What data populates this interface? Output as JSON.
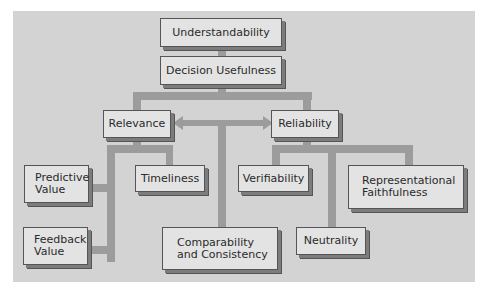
{
  "diagram": {
    "colors": {
      "background": "#ffffff",
      "panel": "#d3d3d3",
      "node_fill": "#e3e3e3",
      "node_shadow": "#7c7c7c",
      "connector": "#9c9c9c",
      "text": "#2a2a2a"
    },
    "nodes": {
      "understandability": {
        "line1": "Understandability"
      },
      "decision_usefulness": {
        "line1": "Decision Usefulness"
      },
      "relevance": {
        "line1": "Relevance"
      },
      "reliability": {
        "line1": "Reliability"
      },
      "predictive_value": {
        "line1": "Predictive",
        "line2": "Value"
      },
      "feedback_value": {
        "line1": "Feedback",
        "line2": "Value"
      },
      "timeliness": {
        "line1": "Timeliness"
      },
      "comparability": {
        "line1": "Comparability",
        "line2": "and Consistency"
      },
      "verifiability": {
        "line1": "Verifiability"
      },
      "neutrality": {
        "line1": "Neutrality"
      },
      "representational_faithfulness": {
        "line1": "Representational",
        "line2": "Faithfulness"
      }
    },
    "edges": [
      {
        "from": "understandability",
        "to": "decision_usefulness"
      },
      {
        "from": "decision_usefulness",
        "to": "relevance"
      },
      {
        "from": "decision_usefulness",
        "to": "reliability"
      },
      {
        "from": "relevance",
        "to": "reliability",
        "type": "bidirectional-arrow"
      },
      {
        "from": "relevance",
        "to": "predictive_value"
      },
      {
        "from": "relevance",
        "to": "feedback_value"
      },
      {
        "from": "relevance",
        "to": "timeliness"
      },
      {
        "from": "relevance-reliability-arrow",
        "to": "comparability"
      },
      {
        "from": "reliability",
        "to": "verifiability"
      },
      {
        "from": "reliability",
        "to": "neutrality"
      },
      {
        "from": "reliability",
        "to": "representational_faithfulness"
      }
    ]
  }
}
